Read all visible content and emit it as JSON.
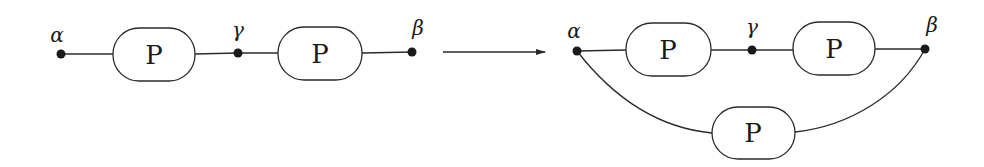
{
  "diagram": {
    "left": {
      "nodes": [
        {
          "id": "alpha",
          "label": "α"
        },
        {
          "id": "gamma",
          "label": "γ"
        },
        {
          "id": "beta",
          "label": "β"
        }
      ],
      "blocks": [
        {
          "label": "P",
          "between": [
            "alpha",
            "gamma"
          ]
        },
        {
          "label": "P",
          "between": [
            "gamma",
            "beta"
          ]
        }
      ]
    },
    "arrow": {
      "direction": "right"
    },
    "right": {
      "nodes": [
        {
          "id": "alpha",
          "label": "α"
        },
        {
          "id": "gamma",
          "label": "γ"
        },
        {
          "id": "beta",
          "label": "β"
        }
      ],
      "blocks": [
        {
          "label": "P",
          "between": [
            "alpha",
            "gamma"
          ]
        },
        {
          "label": "P",
          "between": [
            "gamma",
            "beta"
          ]
        },
        {
          "label": "P",
          "between": [
            "alpha",
            "beta"
          ],
          "position": "bottom"
        }
      ]
    }
  }
}
